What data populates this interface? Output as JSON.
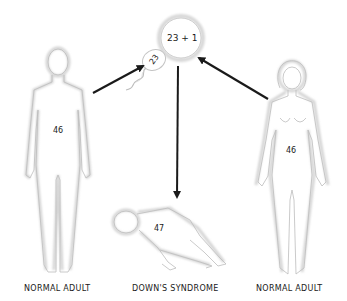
{
  "diagram": {
    "egg": {
      "label": "23 + 1"
    },
    "sperm": {
      "label": "23"
    },
    "figures": [
      {
        "id": "father",
        "chromosomes": "46",
        "caption": "NORMAL ADULT"
      },
      {
        "id": "child",
        "chromosomes": "47",
        "caption": "DOWN'S SYNDROME"
      },
      {
        "id": "mother",
        "chromosomes": "46",
        "caption": "NORMAL ADULT"
      }
    ],
    "arrows": [
      {
        "from": "father",
        "to": "sperm"
      },
      {
        "from": "mother",
        "to": "egg"
      },
      {
        "from": "egg",
        "to": "child"
      }
    ],
    "colors": {
      "arrow": "#1a1a1a",
      "outline": "#c8c8c8",
      "text": "#1a1a1a"
    }
  }
}
